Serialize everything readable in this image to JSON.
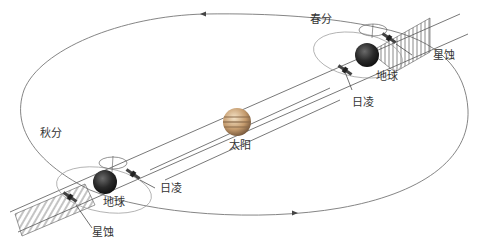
{
  "diagram": {
    "title": "",
    "labels": {
      "spring_equinox": "春分",
      "autumn_equinox": "秋分",
      "sun": "太阳",
      "earth_top": "地球",
      "earth_bottom": "地球",
      "solar_conjunction_top": "日凌",
      "solar_conjunction_bottom": "日凌",
      "eclipse_top": "星蚀",
      "eclipse_bottom": "星蚀"
    },
    "colors": {
      "line": "#555555",
      "orbit": "#777777",
      "sun_light": "#d9b98f",
      "sun_band": "#8a6a4a",
      "earth": "#2b2b2b",
      "hatch": "#666666"
    }
  }
}
